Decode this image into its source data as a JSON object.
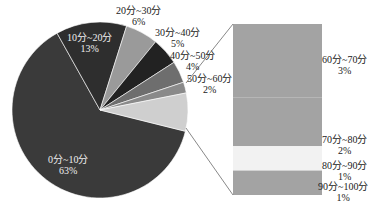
{
  "chart_data": {
    "type": "pie",
    "subtype": "bar-of-pie",
    "title": "",
    "pie": {
      "categories": [
        "0分~10分",
        "10分~20分",
        "20分~30分",
        "30分~40分",
        "40分~50分",
        "50分~60分",
        "其他"
      ],
      "values": [
        63,
        13,
        6,
        5,
        4,
        2,
        7
      ],
      "colors": [
        "#3a3a3a",
        "#2e2e2e",
        "#9a9a9a",
        "#222222",
        "#6e6e6e",
        "#8a8a8a",
        "#cfcfcf"
      ]
    },
    "bar": {
      "categories": [
        "60分~70分",
        "70分~80分",
        "80分~90分",
        "90分~100分"
      ],
      "values": [
        3,
        2,
        1,
        1
      ],
      "colors": [
        "#a3a3a3",
        "#a3a3a3",
        "#f2f2f2",
        "#a3a3a3"
      ]
    },
    "labels": [
      {
        "name": "0分~10分",
        "pct": "63%"
      },
      {
        "name": "10分~20分",
        "pct": "13%"
      },
      {
        "name": "20分~30分",
        "pct": "6%"
      },
      {
        "name": "30分~40分",
        "pct": "5%"
      },
      {
        "name": "40分~50分",
        "pct": "4%"
      },
      {
        "name": "50分~60分",
        "pct": "2%"
      },
      {
        "name": "60分~70分",
        "pct": "3%"
      },
      {
        "name": "70分~80分",
        "pct": "2%"
      },
      {
        "name": "80分~90分",
        "pct": "1%"
      },
      {
        "name": "90分~100分",
        "pct": "1%"
      }
    ],
    "legend": "none",
    "grid": false
  }
}
